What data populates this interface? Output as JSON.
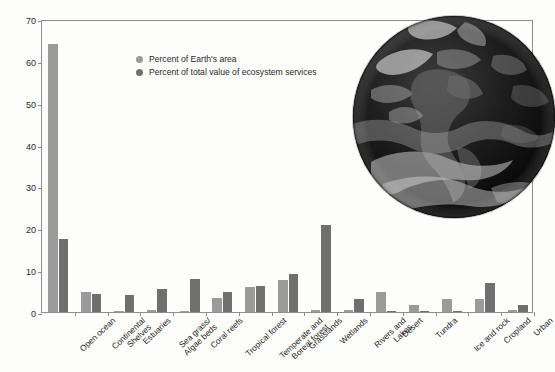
{
  "chart_data": {
    "type": "bar",
    "title": "",
    "xlabel": "",
    "ylabel": "PERCENT",
    "ylim": [
      0,
      70
    ],
    "yticks": [
      0,
      10,
      20,
      30,
      40,
      50,
      60,
      70
    ],
    "grid": false,
    "legend_position": "inside-top-left",
    "categories": [
      "Open ocean",
      "Continental\nShelves",
      "Estuaries",
      "Sea grass/\nAlgae beds",
      "Coral reefs",
      "Tropical forest",
      "Temperate and\nBoreal forest",
      "Grasslands",
      "Wetlands",
      "Rivers and\nLakes",
      "Desert",
      "Tundra",
      "Ice and rock",
      "Cropland",
      "Urban"
    ],
    "series": [
      {
        "name": "Percent of Earth's area",
        "color": "#9b9b9b",
        "values": [
          64.0,
          4.9,
          0.3,
          0.6,
          0.1,
          3.4,
          6.0,
          7.7,
          0.6,
          0.4,
          4.7,
          1.6,
          3.0,
          3.0,
          0.6
        ]
      },
      {
        "name": "Percent of total value of ecosystem services",
        "color": "#6f6f6f",
        "values": [
          17.5,
          4.4,
          4.1,
          5.6,
          7.9,
          4.9,
          6.2,
          9.0,
          20.7,
          3.2,
          0.2,
          0.3,
          0.1,
          7.0,
          1.7
        ]
      }
    ],
    "legend": [
      {
        "label": "Percent of Earth's area",
        "color": "#9b9b9b",
        "swatch": "light"
      },
      {
        "label": "Percent of total value of ecosystem services",
        "color": "#6f6f6f",
        "swatch": "dark"
      }
    ],
    "annotations": [
      {
        "name": "earth-photo",
        "description": "Grayscale satellite photograph of planet Earth showing the Americas"
      }
    ]
  },
  "colors": {
    "bar_light": "#9b9b9b",
    "bar_dark": "#6f6f6f",
    "axis": "#8d8d8d",
    "text": "#1e1e1e",
    "background": "#fdfdfc"
  }
}
